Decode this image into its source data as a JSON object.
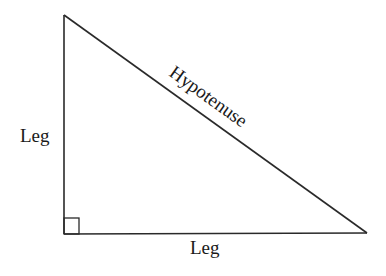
{
  "diagram": {
    "labels": {
      "left_leg": "Leg",
      "bottom_leg": "Leg",
      "hypotenuse": "Hypotenuse"
    },
    "vertices": {
      "top": [
        64,
        15
      ],
      "right_angle": [
        64,
        234
      ],
      "right": [
        367,
        233
      ]
    },
    "colors": {
      "stroke": "#2a2a2a",
      "text": "#1a1a1a",
      "background": "#ffffff"
    }
  }
}
